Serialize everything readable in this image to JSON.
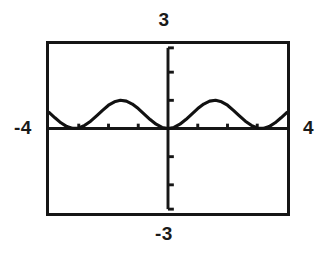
{
  "window": {
    "xmin_label": "-4",
    "xmax_label": "4",
    "ymin_label": "-3",
    "ymax_label": "3"
  },
  "colors": {
    "ink": "#161616",
    "background": "#ffffff",
    "curve": "#111111"
  },
  "chart_data": {
    "type": "line",
    "title": "",
    "xlabel": "",
    "ylabel": "",
    "xlim": [
      -4,
      4
    ],
    "ylim": [
      -3,
      3
    ],
    "grid": false,
    "legend": null,
    "axes": {
      "x_axis_at_y": 0,
      "y_axis_at_x": 0,
      "x_tick_interval": 1,
      "y_tick_interval": 1,
      "x_ticks": [
        -3,
        -2,
        -1,
        1,
        2,
        3
      ],
      "y_ticks": [
        -2,
        -1,
        1,
        2
      ],
      "tick_length_px": 5
    },
    "series": [
      {
        "name": "y = sin^2(x)",
        "description": "non-negative periodic curve, amplitude 1, period pi, touching y=0 at multiples of pi",
        "amplitude": 1,
        "period": 3.14159,
        "baseline": 0,
        "x": [
          -4.0,
          -3.8,
          -3.6,
          -3.4,
          -3.2,
          -3.0,
          -2.8,
          -2.6,
          -2.4,
          -2.2,
          -2.0,
          -1.8,
          -1.6,
          -1.4,
          -1.2,
          -1.0,
          -0.8,
          -0.6,
          -0.4,
          -0.2,
          0.0,
          0.2,
          0.4,
          0.6,
          0.8,
          1.0,
          1.2,
          1.4,
          1.6,
          1.8,
          2.0,
          2.2,
          2.4,
          2.6,
          2.8,
          3.0,
          3.2,
          3.4,
          3.6,
          3.8,
          4.0
        ],
        "y": [
          0.573,
          0.381,
          0.202,
          0.068,
          0.003,
          0.02,
          0.113,
          0.259,
          0.452,
          0.646,
          0.827,
          0.948,
          1.0,
          0.971,
          0.868,
          0.708,
          0.514,
          0.319,
          0.152,
          0.039,
          0.0,
          0.039,
          0.152,
          0.319,
          0.514,
          0.708,
          0.868,
          0.971,
          1.0,
          0.948,
          0.827,
          0.646,
          0.452,
          0.259,
          0.113,
          0.02,
          0.003,
          0.068,
          0.202,
          0.381,
          0.573
        ]
      }
    ]
  }
}
